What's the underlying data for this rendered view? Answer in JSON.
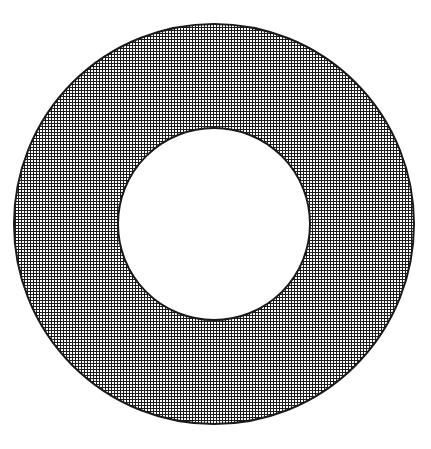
{
  "figure": {
    "shape_name": "annulus",
    "background_color": "#ffffff",
    "canvas": {
      "width": 431,
      "height": 449
    }
  },
  "chart_data": {
    "type": "diagram",
    "subtype": "annulus",
    "title": "",
    "xlabel": "",
    "ylabel": "",
    "grid": false,
    "legend": null,
    "annotations": [],
    "tick_labels": [],
    "shapes": [
      {
        "name": "outer-circle",
        "role": "outer boundary",
        "geometry": "circle",
        "cx": 214,
        "cy": 224,
        "r": 200,
        "stroke_color": "#1a1a1a",
        "stroke_width": 2,
        "fill": "crosshatch"
      },
      {
        "name": "inner-circle",
        "role": "inner boundary (hole)",
        "geometry": "circle",
        "cx": 214,
        "cy": 224,
        "r": 96,
        "stroke_color": "#1a1a1a",
        "stroke_width": 2,
        "fill": "#ffffff"
      }
    ],
    "fill_pattern": {
      "name": "crosshatch-grid",
      "pitch_px": 3,
      "line_width_px": 1,
      "line_color": "#1c1c1c",
      "background_color": "#ffffff",
      "applies_to": "annulus band between inner and outer circle"
    },
    "measurements": {
      "outer_radius_px": 200,
      "inner_radius_px": 96,
      "band_width_px": 104,
      "center_x_px": 214,
      "center_y_px": 224
    }
  }
}
